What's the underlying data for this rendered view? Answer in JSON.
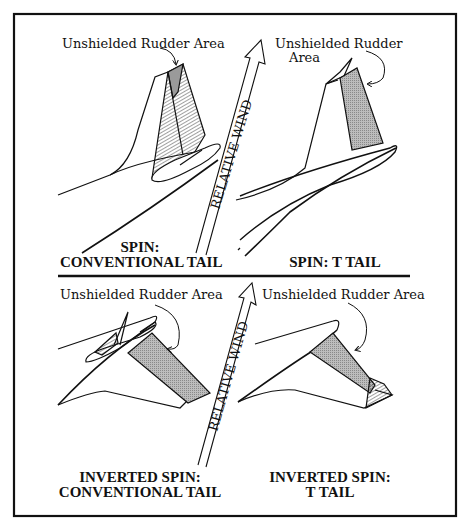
{
  "figure": {
    "colors": {
      "line": "#111111",
      "shade": "#a8a8a8",
      "background": "#ffffff"
    },
    "wind_label": "RELATIVE WIND",
    "panels": [
      {
        "id": "spin-conventional",
        "callout": "Unshielded Rudder Area",
        "caption_line1": "SPIN:",
        "caption_line2": "CONVENTIONAL TAIL"
      },
      {
        "id": "spin-t-tail",
        "callout_line1": "Unshielded Rudder",
        "callout_line2": "Area",
        "caption_line1": "SPIN: T TAIL"
      },
      {
        "id": "inverted-conventional",
        "callout": "Unshielded Rudder Area",
        "caption_line1": "INVERTED SPIN:",
        "caption_line2": "CONVENTIONAL TAIL"
      },
      {
        "id": "inverted-t-tail",
        "callout": "Unshielded Rudder Area",
        "caption_line1": "INVERTED SPIN:",
        "caption_line2": "T TAIL"
      }
    ]
  }
}
